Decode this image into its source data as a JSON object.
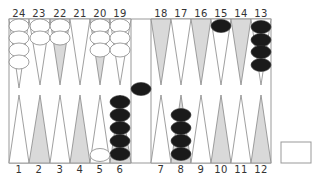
{
  "board": {
    "top_labels": [
      "24",
      "23",
      "22",
      "21",
      "20",
      "19",
      "18",
      "17",
      "16",
      "15",
      "14",
      "13"
    ],
    "bottom_labels": [
      "1",
      "2",
      "3",
      "4",
      "5",
      "6",
      "7",
      "8",
      "9",
      "10",
      "11",
      "12"
    ],
    "colors": {
      "point_dark": "#d9d9d9",
      "point_light": "#ffffff",
      "line": "#888888",
      "black_checker": "#1a1a1a",
      "white_checker": "#ffffff"
    },
    "points": [
      {
        "point": 24,
        "color": "white",
        "count": 4
      },
      {
        "point": 23,
        "color": "white",
        "count": 2
      },
      {
        "point": 22,
        "color": "white",
        "count": 2
      },
      {
        "point": 21,
        "color": "none",
        "count": 0
      },
      {
        "point": 20,
        "color": "white",
        "count": 3
      },
      {
        "point": 19,
        "color": "white",
        "count": 3
      },
      {
        "point": 18,
        "color": "none",
        "count": 0
      },
      {
        "point": 17,
        "color": "none",
        "count": 0
      },
      {
        "point": 16,
        "color": "none",
        "count": 0
      },
      {
        "point": 15,
        "color": "black",
        "count": 1
      },
      {
        "point": 14,
        "color": "none",
        "count": 0
      },
      {
        "point": 13,
        "color": "black",
        "count": 4
      },
      {
        "point": 1,
        "color": "none",
        "count": 0
      },
      {
        "point": 2,
        "color": "none",
        "count": 0
      },
      {
        "point": 3,
        "color": "none",
        "count": 0
      },
      {
        "point": 4,
        "color": "none",
        "count": 0
      },
      {
        "point": 5,
        "color": "white",
        "count": 1
      },
      {
        "point": 6,
        "color": "black",
        "count": 5
      },
      {
        "point": 7,
        "color": "none",
        "count": 0
      },
      {
        "point": 8,
        "color": "black",
        "count": 4
      },
      {
        "point": 9,
        "color": "none",
        "count": 0
      },
      {
        "point": 10,
        "color": "none",
        "count": 0
      },
      {
        "point": 11,
        "color": "none",
        "count": 0
      },
      {
        "point": 12,
        "color": "none",
        "count": 0
      }
    ],
    "bar": {
      "black": 1,
      "white": 0
    },
    "cube": {
      "value": ""
    }
  }
}
